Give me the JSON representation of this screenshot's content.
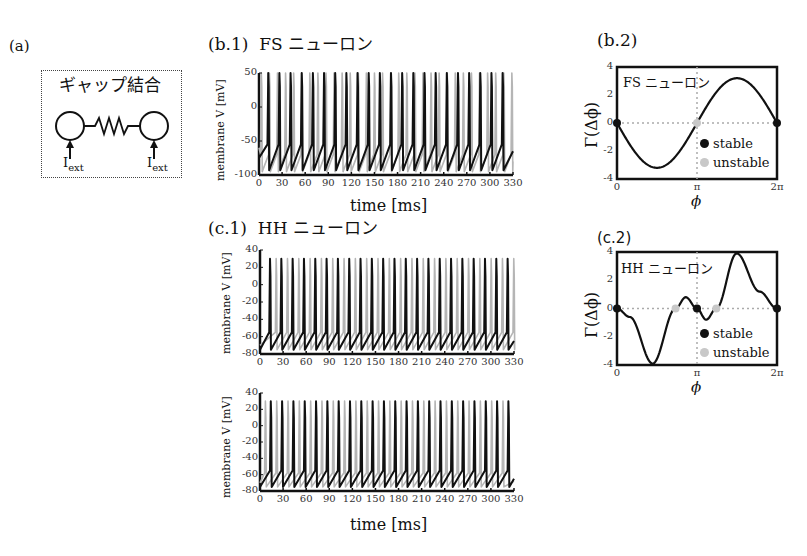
{
  "panel_a": {
    "label": "(a)",
    "title": "ギャップ結合",
    "input_label_left": "I",
    "input_label_left_sub": "ext",
    "input_label_right": "I",
    "input_label_right_sub": "ext"
  },
  "panel_b1": {
    "label": "(b.1)",
    "title": "FS ニューロン",
    "ylabel": "membrane V [mV]",
    "xlabel": "time [ms]"
  },
  "panel_b2": {
    "label": "(b.2)",
    "inset": "FS ニューロン",
    "ylabel": "Γ(Δϕ)",
    "xlabel": "ϕ",
    "legend_stable": "stable",
    "legend_unstable": "unstable"
  },
  "panel_c1": {
    "label": "(c.1)",
    "title": "HH ニューロン",
    "ylabel": "membrane V [mV]",
    "xlabel": "time [ms]"
  },
  "panel_c2": {
    "label": "(c.2)",
    "inset": "HH ニューロン",
    "ylabel": "Γ(Δϕ)",
    "xlabel": "ϕ",
    "legend_stable": "stable",
    "legend_unstable": "unstable"
  },
  "colors": {
    "black": "#111111",
    "grey": "#b5b5b5",
    "dot_grey": "#c8c8c8"
  },
  "chart_data": [
    {
      "id": "b.1",
      "type": "line",
      "title": "FS ニューロン",
      "xlabel": "time [ms]",
      "ylabel": "membrane V [mV]",
      "xlim": [
        0,
        330
      ],
      "ylim": [
        -100,
        50
      ],
      "xticks": [
        0,
        30,
        60,
        90,
        120,
        150,
        180,
        210,
        240,
        270,
        300,
        330
      ],
      "yticks": [
        50,
        0,
        -50,
        -100
      ],
      "series": [
        {
          "name": "neuron 1 (black)",
          "spike_period_ms": 14.5,
          "first_spike_ms": 12,
          "peak": 50,
          "trough": -93
        },
        {
          "name": "neuron 2 (grey)",
          "spike_period_ms": 10.5,
          "first_spike_ms": 3,
          "peak": 50,
          "trough": -95
        }
      ]
    },
    {
      "id": "b.2",
      "type": "line",
      "title": "FS ニューロン",
      "xlabel": "ϕ",
      "ylabel": "Γ(Δϕ)",
      "xlim": [
        0,
        6.283
      ],
      "ylim": [
        -4,
        4
      ],
      "xticks": [
        "0",
        "π",
        "2π"
      ],
      "yticks": [
        4,
        2,
        0,
        -2,
        -4
      ],
      "curve": "≈ -3.2·sin(ϕ)",
      "stable_points": [
        0,
        6.283
      ],
      "unstable_points": [
        3.1416
      ]
    },
    {
      "id": "c.1",
      "type": "line",
      "title": "HH ニューロン",
      "xlabel": "time [ms]",
      "ylabel": "membrane V [mV]",
      "xlim": [
        0,
        330
      ],
      "ylim": [
        -80,
        40
      ],
      "xticks": [
        0,
        30,
        60,
        90,
        120,
        150,
        180,
        210,
        240,
        270,
        300,
        330
      ],
      "yticks": [
        40,
        20,
        0,
        -20,
        -40,
        -60,
        -80
      ],
      "subplots": [
        {
          "series": [
            {
              "name": "black",
              "spike_period_ms": 14.7,
              "first_spike_ms": 13
            },
            {
              "name": "grey",
              "spike_period_ms": 14.7,
              "first_spike_ms": 21
            }
          ]
        },
        {
          "series": [
            {
              "name": "black",
              "spike_period_ms": 14.7,
              "first_spike_ms": 14
            },
            {
              "name": "grey",
              "spike_period_ms": 14.7,
              "first_spike_ms": 7
            }
          ]
        }
      ]
    },
    {
      "id": "c.2",
      "type": "line",
      "title": "HH ニューロン",
      "xlabel": "ϕ",
      "ylabel": "Γ(Δϕ)",
      "xlim": [
        0,
        6.283
      ],
      "ylim": [
        -4,
        4
      ],
      "xticks": [
        "0",
        "π",
        "2π"
      ],
      "yticks": [
        4,
        2,
        0,
        -2,
        -4
      ],
      "curve_points": [
        [
          0,
          0
        ],
        [
          0.5,
          -0.6
        ],
        [
          1.4,
          -3.9
        ],
        [
          2.3,
          0
        ],
        [
          2.7,
          0.8
        ],
        [
          3.14,
          0
        ],
        [
          3.5,
          -0.8
        ],
        [
          3.9,
          0
        ],
        [
          4.7,
          3.9
        ],
        [
          5.6,
          1.2
        ],
        [
          6.283,
          0
        ]
      ],
      "stable_points": [
        0,
        3.1416,
        6.283
      ],
      "unstable_points": [
        2.3,
        3.9
      ]
    }
  ]
}
